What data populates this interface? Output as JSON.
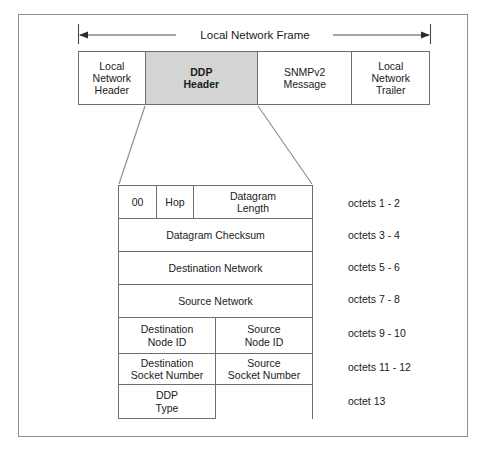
{
  "diagram": {
    "title_span_label": "Local Network Frame",
    "colors": {
      "shaded_field": "#d4d4d4",
      "border": "#6f6f6f",
      "outer_border": "#8e8e8e",
      "text": "#1a1a1a",
      "background": "#ffffff"
    },
    "frame_fields": [
      {
        "label": "Local\nNetwork\nHeader",
        "shaded": false
      },
      {
        "label": "DDP\nHeader",
        "shaded": true
      },
      {
        "label": "SNMPv2\nMessage",
        "shaded": false
      },
      {
        "label": "Local\nNetwork\nTrailer",
        "shaded": false
      }
    ],
    "frame_field_labels": {
      "local_network_header": "Local Network Header",
      "ddp_header": "DDP Header",
      "snmpv2_message": "SNMPv2 Message",
      "local_network_trailer": "Local Network Trailer"
    },
    "ddp_header_rows": [
      {
        "cells": [
          "00",
          "Hop",
          "Datagram Length"
        ],
        "octets": "octets 1 - 2"
      },
      {
        "cells": [
          "Datagram Checksum"
        ],
        "octets": "octets 3 - 4"
      },
      {
        "cells": [
          "Destination Network"
        ],
        "octets": "octets 5 - 6"
      },
      {
        "cells": [
          "Source Network"
        ],
        "octets": "octets 7 - 8"
      },
      {
        "cells": [
          "Destination Node ID",
          "Source Node ID"
        ],
        "octets": "octets 9 - 10"
      },
      {
        "cells": [
          "Destination Socket Number",
          "Source Socket Number"
        ],
        "octets": "octets 11 - 12"
      },
      {
        "cells": [
          "DDP Type",
          ""
        ],
        "octets": "octet 13"
      }
    ],
    "cell_text": {
      "r1c1": "00",
      "r1c2": "Hop",
      "r1c3_line1": "Datagram",
      "r1c3_line2": "Length",
      "r2": "Datagram Checksum",
      "r3": "Destination Network",
      "r4": "Source Network",
      "r5c1_line1": "Destination",
      "r5c1_line2": "Node ID",
      "r5c2_line1": "Source",
      "r5c2_line2": "Node ID",
      "r6c1_line1": "Destination",
      "r6c1_line2": "Socket Number",
      "r6c2_line1": "Source",
      "r6c2_line2": "Socket Number",
      "r7c1_line1": "DDP",
      "r7c1_line2": "Type"
    },
    "frame_cell_text": {
      "f0_line1": "Local",
      "f0_line2": "Network",
      "f0_line3": "Header",
      "f1_line1": "DDP",
      "f1_line2": "Header",
      "f2_line1": "SNMPv2",
      "f2_line2": "Message",
      "f3_line1": "Local",
      "f3_line2": "Network",
      "f3_line3": "Trailer"
    },
    "octet_labels": [
      "octets 1 - 2",
      "octets 3 - 4",
      "octets 5 - 6",
      "octets 7 - 8",
      "octets 9 - 10",
      "octets 11 - 12",
      "octet 13"
    ]
  }
}
